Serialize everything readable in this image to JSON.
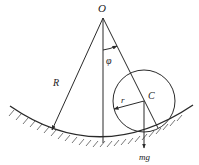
{
  "diagram": {
    "labels": {
      "origin": "O",
      "angle": "φ",
      "big_radius": "R",
      "small_radius": "r",
      "center": "C",
      "weight": "mg"
    },
    "colors": {
      "line": "#2a2a2a",
      "background": "#ffffff"
    }
  }
}
